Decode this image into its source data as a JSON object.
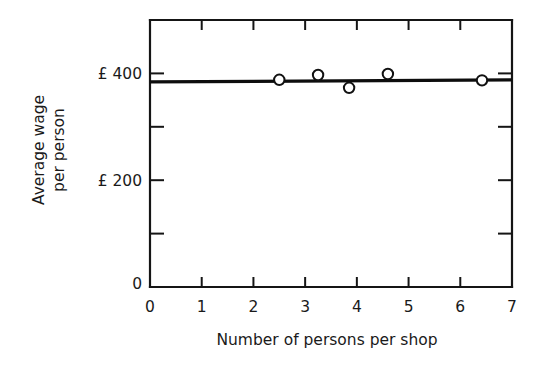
{
  "chart_data": {
    "type": "scatter",
    "title": "",
    "xlabel": "Number of persons per shop",
    "ylabel_line1": "Average wage",
    "ylabel_line2": "per person",
    "ylabel": "Average wage per person",
    "xlim": [
      0,
      7
    ],
    "ylim": [
      0,
      500
    ],
    "grid": false,
    "legend": null,
    "x_ticks": [
      0,
      1,
      2,
      3,
      4,
      5,
      6,
      7
    ],
    "x_tick_labels": [
      "0",
      "1",
      "2",
      "3",
      "4",
      "5",
      "6",
      "7"
    ],
    "y_ticks": [
      0,
      100,
      200,
      300,
      400
    ],
    "y_tick_labels": [
      "0",
      "",
      "£ 200",
      "",
      "£ 400"
    ],
    "y_labeled_ticks": [
      {
        "value": 0,
        "label": "0"
      },
      {
        "value": 200,
        "label": "£ 200"
      },
      {
        "value": 400,
        "label": "£ 400"
      }
    ],
    "points": [
      {
        "x": 2.5,
        "y": 388
      },
      {
        "x": 3.25,
        "y": 397
      },
      {
        "x": 3.85,
        "y": 373
      },
      {
        "x": 4.6,
        "y": 399
      },
      {
        "x": 6.42,
        "y": 387
      }
    ],
    "series": [
      {
        "name": "Average wage per person",
        "x": [
          2.5,
          3.25,
          3.85,
          4.6,
          6.42
        ],
        "values": [
          388,
          397,
          373,
          399,
          387
        ]
      }
    ],
    "trend_line": {
      "name": "fitted regression line",
      "x_start": 0,
      "y_start": 384,
      "x_end": 7,
      "y_end": 388
    }
  },
  "figure": {
    "background_color": "#ffffff",
    "line_color": "#111111",
    "marker_fill": "#ffffff"
  }
}
